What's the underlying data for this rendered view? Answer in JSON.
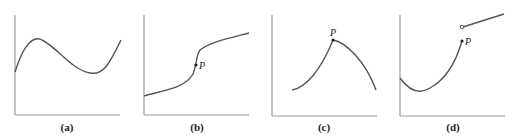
{
  "figure": {
    "panels": [
      {
        "id": "a",
        "caption": "(a)",
        "point_label": ""
      },
      {
        "id": "b",
        "caption": "(b)",
        "point_label": "P"
      },
      {
        "id": "c",
        "caption": "(c)",
        "point_label": "P"
      },
      {
        "id": "d",
        "caption": "(d)",
        "point_label": "P"
      }
    ],
    "colors": {
      "axis": "#9a9a9a",
      "curve": "#555555",
      "text": "#222222"
    }
  }
}
